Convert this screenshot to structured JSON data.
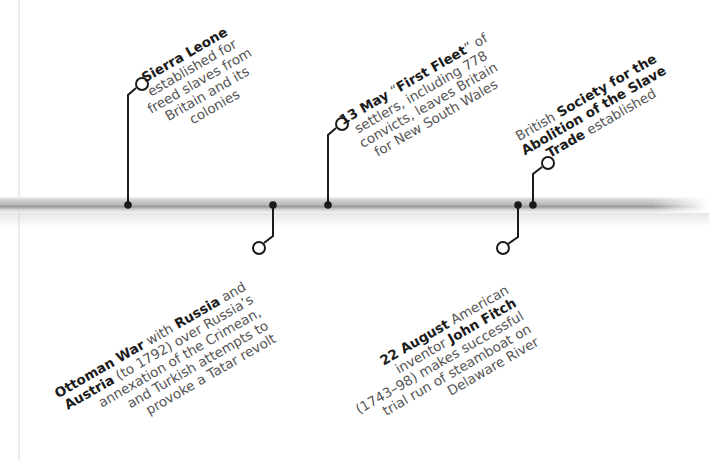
{
  "timeline": {
    "bar_color": "#b8b8b8",
    "connector_color": "#1a1a1a",
    "events_above": [
      {
        "id": "sierra-leone",
        "marker_x": 128,
        "circle": [
          142,
          84
        ],
        "lines": [
          {
            "bold": "Sierra Leone",
            "text": ""
          },
          {
            "bold": "",
            "text": "established for"
          },
          {
            "bold": "",
            "text": "freed slaves from"
          },
          {
            "bold": "",
            "text": "Britain and its"
          },
          {
            "bold": "",
            "text": "colonies"
          }
        ]
      },
      {
        "id": "first-fleet",
        "marker_x": 328,
        "circle": [
          342,
          124
        ],
        "lines": [
          {
            "bold": "13 May",
            "text": " “",
            "bold2": "First Fleet",
            "text2": "” of"
          },
          {
            "bold": "",
            "text": "settlers, including 778"
          },
          {
            "bold": "",
            "text": "convicts, leaves Britain"
          },
          {
            "bold": "",
            "text": "for New South Wales"
          }
        ]
      },
      {
        "id": "abolition-society",
        "marker_x": 533,
        "circle": [
          548,
          163
        ],
        "lines": [
          {
            "bold": "",
            "text": "British ",
            "bold2": "Society for the",
            "text2": ""
          },
          {
            "bold": "Abolition of the Slave",
            "text": ""
          },
          {
            "bold": "Trade",
            "text": " established"
          }
        ]
      }
    ],
    "events_below": [
      {
        "id": "ottoman-war",
        "marker_x": 273,
        "circle": [
          259,
          248
        ],
        "lines": [
          {
            "bold": "Ottoman War",
            "text": " with ",
            "bold2": "Russia",
            "text2": " and"
          },
          {
            "bold": "Austria",
            "text": " (to 1792) over Russia’s"
          },
          {
            "bold": "",
            "text": "annexation of the Crimean,"
          },
          {
            "bold": "",
            "text": "and Turkish attempts to"
          },
          {
            "bold": "",
            "text": "provoke a Tatar revolt"
          }
        ]
      },
      {
        "id": "john-fitch",
        "marker_x": 518,
        "circle": [
          503,
          248
        ],
        "lines": [
          {
            "bold": "22 August",
            "text": " American"
          },
          {
            "bold": "",
            "text": "inventor ",
            "bold2": "John Fitch",
            "text2": ""
          },
          {
            "bold": "",
            "text": "(1743–98) makes successful"
          },
          {
            "bold": "",
            "text": "trial run of steamboat on"
          },
          {
            "bold": "",
            "text": "Delaware River"
          }
        ]
      }
    ]
  }
}
